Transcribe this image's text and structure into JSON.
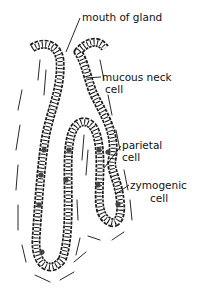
{
  "diagram": {
    "type": "anatomical illustration",
    "labels": {
      "mouth": "mouth of gland",
      "mucous_line1": "mucous neck",
      "mucous_line2": "cell",
      "parietal_line1": "parietal",
      "parietal_line2": "cell",
      "zymogenic_line1": "zymogenic",
      "zymogenic_line2": "cell"
    },
    "colors": {
      "ink": "#111111",
      "background": "#ffffff"
    }
  }
}
